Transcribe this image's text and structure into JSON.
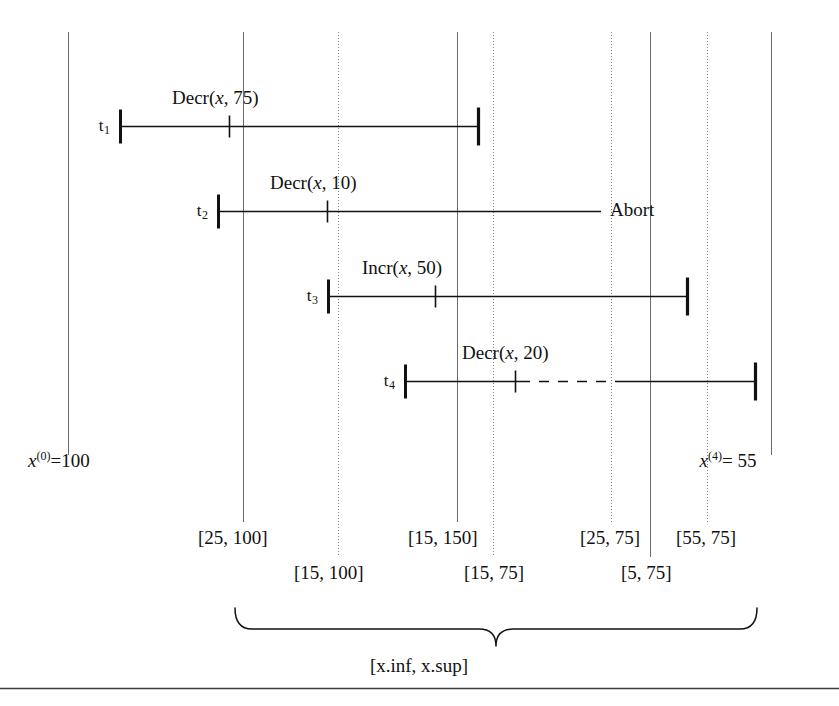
{
  "figure": {
    "axis_left": {
      "var": "x",
      "exponent": "(0)",
      "eq": "=100"
    },
    "axis_right": {
      "var": "x",
      "exponent": "(4)",
      "eq": "= 55"
    },
    "brace_label": "[x.inf, x.sup]",
    "abort_label": "Abort"
  },
  "transactions": [
    {
      "name": "t",
      "index": "1",
      "operation": "Decr(",
      "op_var": "x",
      "op_args": ", 75)",
      "start_x": 120,
      "end_x": 478,
      "tick_x": 229,
      "y": 126,
      "label_x": 172,
      "label_y": 88,
      "has_end_cap": true,
      "dashed_from": null,
      "dashed_to": null
    },
    {
      "name": "t",
      "index": "2",
      "operation": "Decr(",
      "op_var": "x",
      "op_args": ", 10)",
      "start_x": 218,
      "end_x": 601,
      "tick_x": 327,
      "y": 211,
      "label_x": 270,
      "label_y": 173,
      "has_end_cap": false,
      "dashed_from": null,
      "dashed_to": null
    },
    {
      "name": "t",
      "index": "3",
      "operation": "Incr(",
      "op_var": "x",
      "op_args": ", 50)",
      "start_x": 328,
      "end_x": 687,
      "tick_x": 435,
      "y": 296,
      "label_x": 362,
      "label_y": 258,
      "has_end_cap": true,
      "dashed_from": null,
      "dashed_to": null
    },
    {
      "name": "t",
      "index": "4",
      "operation": "Decr(",
      "op_var": "x",
      "op_args": ", 20)",
      "start_x": 405,
      "end_x": 755,
      "tick_x": 515,
      "y": 381,
      "label_x": 462,
      "label_y": 343,
      "has_end_cap": true,
      "dashed_from": 520,
      "dashed_to": 621
    }
  ],
  "vertical_lines": [
    {
      "x": 68,
      "style": "solid",
      "top": 32,
      "bottom": 455
    },
    {
      "x": 243,
      "style": "solid",
      "top": 32,
      "bottom": 522
    },
    {
      "x": 338,
      "style": "dotted",
      "top": 32,
      "bottom": 557
    },
    {
      "x": 457,
      "style": "solid",
      "top": 32,
      "bottom": 522
    },
    {
      "x": 493,
      "style": "dotted",
      "top": 32,
      "bottom": 557
    },
    {
      "x": 611,
      "style": "dotted",
      "top": 32,
      "bottom": 522
    },
    {
      "x": 650,
      "style": "solid",
      "top": 32,
      "bottom": 557
    },
    {
      "x": 707,
      "style": "dotted",
      "top": 32,
      "bottom": 522
    },
    {
      "x": 771,
      "style": "solid",
      "top": 32,
      "bottom": 455
    }
  ],
  "interval_labels": [
    {
      "text": "[25, 100]",
      "x": 198,
      "y": 528,
      "row": "top"
    },
    {
      "text": "[15, 100]",
      "x": 294,
      "y": 563,
      "row": "bottom"
    },
    {
      "text": "[15, 150]",
      "x": 408,
      "y": 528,
      "row": "top"
    },
    {
      "text": "[15, 75]",
      "x": 464,
      "y": 563,
      "row": "bottom"
    },
    {
      "text": "[25, 75]",
      "x": 580,
      "y": 528,
      "row": "top"
    },
    {
      "text": "[5, 75]",
      "x": 621,
      "y": 563,
      "row": "bottom"
    },
    {
      "text": "[55, 75]",
      "x": 676,
      "y": 528,
      "row": "top"
    }
  ],
  "brace": {
    "left_x": 235,
    "right_x": 757,
    "y_top": 608,
    "y_tip": 646,
    "label_x": 419,
    "label_y": 656
  },
  "bottom_rule": {
    "x1": 0,
    "x2": 839,
    "y": 688
  },
  "colors": {
    "ink": "#111111",
    "gridline": "#6b6b6b",
    "background": "#ffffff"
  }
}
